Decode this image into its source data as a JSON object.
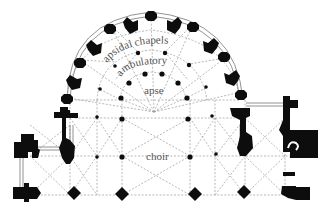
{
  "diagram": {
    "type": "architectural floor plan",
    "labels": {
      "apsidal_chapels": "apsidal chapels",
      "ambulatory": "ambulatory",
      "apse": "apse",
      "choir": "choir"
    },
    "colors": {
      "background": "#ffffff",
      "piers": "#0d0d0d",
      "ribs": "#9a9a9a",
      "label_text": "#555555"
    }
  }
}
